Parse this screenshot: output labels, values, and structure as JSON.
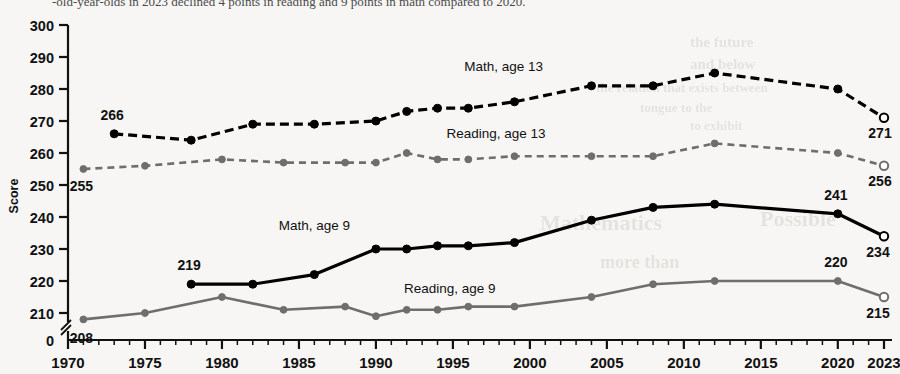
{
  "page": {
    "caption_partial": "-old-year-olds in 2023 declined 4 points in reading and 9 points in math compared to 2020."
  },
  "chart_data": {
    "type": "line",
    "title": "",
    "xlabel": "",
    "ylabel": "Score",
    "xlim": [
      1970,
      2023
    ],
    "ylim": [
      205,
      300
    ],
    "yticks": [
      210,
      220,
      230,
      240,
      250,
      260,
      270,
      280,
      290,
      300
    ],
    "y_axis_break_label": "0",
    "xticks": [
      1970,
      1975,
      1980,
      1985,
      1990,
      1995,
      2000,
      2005,
      2010,
      2015,
      2020,
      2023
    ],
    "xtick_labels": [
      "1970",
      "1975",
      "1980",
      "1985",
      "1990",
      "1995",
      "2000",
      "2005",
      "2010",
      "2015",
      "2020",
      "2023"
    ],
    "minor_x_ticks_every": 1,
    "grid": false,
    "legend_position": "inline-annotations",
    "series": [
      {
        "name": "Math, age 13",
        "label": "Math, age 13",
        "style": "dashed",
        "color": "#000000",
        "linewidth": 3.2,
        "marker": "filled-circle",
        "label_x": 1998.3,
        "label_y": 285.5,
        "points": [
          {
            "x": 1973,
            "y": 266,
            "open": false
          },
          {
            "x": 1978,
            "y": 264,
            "open": false
          },
          {
            "x": 1982,
            "y": 269,
            "open": false
          },
          {
            "x": 1986,
            "y": 269,
            "open": false
          },
          {
            "x": 1990,
            "y": 270,
            "open": false
          },
          {
            "x": 1992,
            "y": 273,
            "open": false
          },
          {
            "x": 1994,
            "y": 274,
            "open": false
          },
          {
            "x": 1996,
            "y": 274,
            "open": false
          },
          {
            "x": 1999,
            "y": 276,
            "open": false
          },
          {
            "x": 2004,
            "y": 281,
            "open": false
          },
          {
            "x": 2008,
            "y": 281,
            "open": false
          },
          {
            "x": 2012,
            "y": 285,
            "open": false
          },
          {
            "x": 2020,
            "y": 280,
            "open": false
          },
          {
            "x": 2023,
            "y": 271,
            "open": true
          }
        ],
        "value_labels": [
          {
            "x": 1973,
            "y": 266,
            "text": "266",
            "dx": -2,
            "dy": -14
          },
          {
            "x": 2023,
            "y": 271,
            "text": "271",
            "dx": -4,
            "dy": 20
          }
        ]
      },
      {
        "name": "Reading, age 13",
        "label": "Reading, age 13",
        "style": "dashed",
        "color": "#6e6e6e",
        "linewidth": 2.6,
        "marker": "filled-circle",
        "label_x": 1997.8,
        "label_y": 264.6,
        "points": [
          {
            "x": 1971,
            "y": 255,
            "open": false
          },
          {
            "x": 1975,
            "y": 256,
            "open": false
          },
          {
            "x": 1980,
            "y": 258,
            "open": false
          },
          {
            "x": 1984,
            "y": 257,
            "open": false
          },
          {
            "x": 1988,
            "y": 257,
            "open": false
          },
          {
            "x": 1990,
            "y": 257,
            "open": false
          },
          {
            "x": 1992,
            "y": 260,
            "open": false
          },
          {
            "x": 1994,
            "y": 258,
            "open": false
          },
          {
            "x": 1996,
            "y": 258,
            "open": false
          },
          {
            "x": 1999,
            "y": 259,
            "open": false
          },
          {
            "x": 2004,
            "y": 259,
            "open": false
          },
          {
            "x": 2008,
            "y": 259,
            "open": false
          },
          {
            "x": 2012,
            "y": 263,
            "open": false
          },
          {
            "x": 2020,
            "y": 260,
            "open": false
          },
          {
            "x": 2023,
            "y": 256,
            "open": true
          }
        ],
        "value_labels": [
          {
            "x": 1971,
            "y": 255,
            "text": "255",
            "dx": -2,
            "dy": 22
          },
          {
            "x": 2023,
            "y": 256,
            "text": "256",
            "dx": -4,
            "dy": 20
          }
        ]
      },
      {
        "name": "Math, age 9",
        "label": "Math, age 9",
        "style": "solid",
        "color": "#000000",
        "linewidth": 3.2,
        "marker": "filled-circle",
        "label_x": 1986.0,
        "label_y": 236.0,
        "points": [
          {
            "x": 1978,
            "y": 219,
            "open": false
          },
          {
            "x": 1982,
            "y": 219,
            "open": false
          },
          {
            "x": 1986,
            "y": 222,
            "open": false
          },
          {
            "x": 1990,
            "y": 230,
            "open": false
          },
          {
            "x": 1992,
            "y": 230,
            "open": false
          },
          {
            "x": 1994,
            "y": 231,
            "open": false
          },
          {
            "x": 1996,
            "y": 231,
            "open": false
          },
          {
            "x": 1999,
            "y": 232,
            "open": false
          },
          {
            "x": 2004,
            "y": 239,
            "open": false
          },
          {
            "x": 2008,
            "y": 243,
            "open": false
          },
          {
            "x": 2012,
            "y": 244,
            "open": false
          },
          {
            "x": 2020,
            "y": 241,
            "open": false
          },
          {
            "x": 2023,
            "y": 234,
            "open": true
          }
        ],
        "value_labels": [
          {
            "x": 1978,
            "y": 219,
            "text": "219",
            "dx": -2,
            "dy": -14
          },
          {
            "x": 2020,
            "y": 241,
            "text": "241",
            "dx": -2,
            "dy": -14
          },
          {
            "x": 2023,
            "y": 234,
            "text": "234",
            "dx": -6,
            "dy": 21
          }
        ]
      },
      {
        "name": "Reading, age 9",
        "label": "Reading, age 9",
        "style": "solid",
        "color": "#6e6e6e",
        "linewidth": 2.6,
        "marker": "filled-circle",
        "label_x": 1994.8,
        "label_y": 216.2,
        "points": [
          {
            "x": 1971,
            "y": 208,
            "open": false
          },
          {
            "x": 1975,
            "y": 210,
            "open": false
          },
          {
            "x": 1980,
            "y": 215,
            "open": false
          },
          {
            "x": 1984,
            "y": 211,
            "open": false
          },
          {
            "x": 1988,
            "y": 212,
            "open": false
          },
          {
            "x": 1990,
            "y": 209,
            "open": false
          },
          {
            "x": 1992,
            "y": 211,
            "open": false
          },
          {
            "x": 1994,
            "y": 211,
            "open": false
          },
          {
            "x": 1996,
            "y": 212,
            "open": false
          },
          {
            "x": 1999,
            "y": 212,
            "open": false
          },
          {
            "x": 2004,
            "y": 215,
            "open": false
          },
          {
            "x": 2008,
            "y": 219,
            "open": false
          },
          {
            "x": 2012,
            "y": 220,
            "open": false
          },
          {
            "x": 2020,
            "y": 220,
            "open": false
          },
          {
            "x": 2023,
            "y": 215,
            "open": true
          }
        ],
        "value_labels": [
          {
            "x": 1971,
            "y": 208,
            "text": "208",
            "dx": -2,
            "dy": 24
          },
          {
            "x": 2020,
            "y": 220,
            "text": "220",
            "dx": -2,
            "dy": -14
          },
          {
            "x": 2023,
            "y": 215,
            "text": "215",
            "dx": -6,
            "dy": 21
          }
        ]
      }
    ]
  },
  "bleed_texts": [
    {
      "text": "the future",
      "x": 690,
      "y": 34,
      "size": 15
    },
    {
      "text": "and below",
      "x": 690,
      "y": 56,
      "size": 15
    },
    {
      "text": "the relation that exists between",
      "x": 596,
      "y": 80,
      "size": 13
    },
    {
      "text": "tongue to the",
      "x": 640,
      "y": 100,
      "size": 13
    },
    {
      "text": "to exhibit",
      "x": 690,
      "y": 118,
      "size": 13
    },
    {
      "text": "Mathematics",
      "x": 540,
      "y": 210,
      "size": 22
    },
    {
      "text": "Possible",
      "x": 760,
      "y": 206,
      "size": 22
    },
    {
      "text": "more than",
      "x": 600,
      "y": 252,
      "size": 18
    }
  ]
}
